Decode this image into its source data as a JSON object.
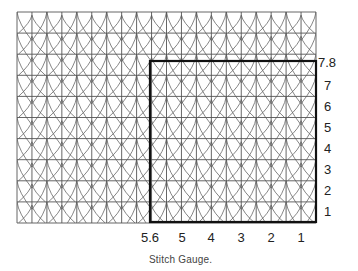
{
  "figure": {
    "caption": "Stitch Gauge.",
    "grid": {
      "columns": 10,
      "rows": 10,
      "line_color": "#555555",
      "frame_color": "#111111"
    },
    "gauge_frame": {
      "label": "gauge-measurement-box"
    },
    "y_labels": [
      {
        "text": "7.8",
        "y": 62
      },
      {
        "text": "7",
        "y": 85
      },
      {
        "text": "6",
        "y": 106
      },
      {
        "text": "5",
        "y": 127
      },
      {
        "text": "4",
        "y": 148
      },
      {
        "text": "3",
        "y": 169
      },
      {
        "text": "2",
        "y": 190
      },
      {
        "text": "1",
        "y": 211
      }
    ],
    "x_labels": [
      {
        "text": "5.6",
        "x": 150
      },
      {
        "text": "5",
        "x": 182
      },
      {
        "text": "4",
        "x": 211
      },
      {
        "text": "3",
        "x": 241
      },
      {
        "text": "2",
        "x": 271
      },
      {
        "text": "1",
        "x": 301
      }
    ]
  }
}
